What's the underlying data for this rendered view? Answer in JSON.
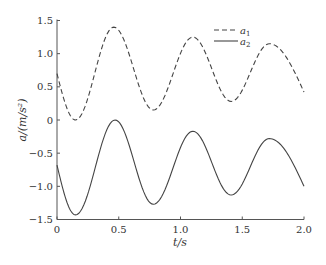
{
  "chart_data": {
    "type": "line",
    "title": "",
    "xlabel": "t/s",
    "ylabel": "a/(m/s²)",
    "xlim": [
      0,
      2.0
    ],
    "ylim": [
      -1.5,
      1.5
    ],
    "xticks": [
      0,
      0.5,
      1.0,
      1.5,
      2.0
    ],
    "xtick_labels": [
      "0",
      "0.5",
      "1.0",
      "1.5",
      "2.0"
    ],
    "yticks": [
      -1.5,
      -1.0,
      -0.5,
      0,
      0.5,
      1.0,
      1.5
    ],
    "ytick_labels": [
      "−1.5",
      "−1.0",
      "−0.5",
      "0",
      "0.5",
      "1.0",
      "1.5"
    ],
    "grid": false,
    "legend_position": "upper right",
    "series": [
      {
        "name": "a1",
        "label_main": "a",
        "label_sub": "1",
        "style": "dashed",
        "color": "#444444",
        "x": [
          0,
          0.15,
          0.46,
          0.78,
          1.1,
          1.41,
          1.72,
          2.0
        ],
        "y": [
          0.7,
          0.0,
          1.4,
          0.15,
          1.25,
          0.28,
          1.15,
          0.42
        ]
      },
      {
        "name": "a2",
        "label_main": "a",
        "label_sub": "2",
        "style": "solid",
        "color": "#444444",
        "x": [
          0,
          0.15,
          0.47,
          0.78,
          1.1,
          1.41,
          1.72,
          2.0
        ],
        "y": [
          -0.68,
          -1.43,
          0.0,
          -1.27,
          -0.17,
          -1.13,
          -0.28,
          -1.0
        ]
      }
    ]
  },
  "layout": {
    "plot": {
      "x0": 57,
      "x1": 304,
      "y_top": 20.5,
      "y_bottom": 219.5
    }
  }
}
